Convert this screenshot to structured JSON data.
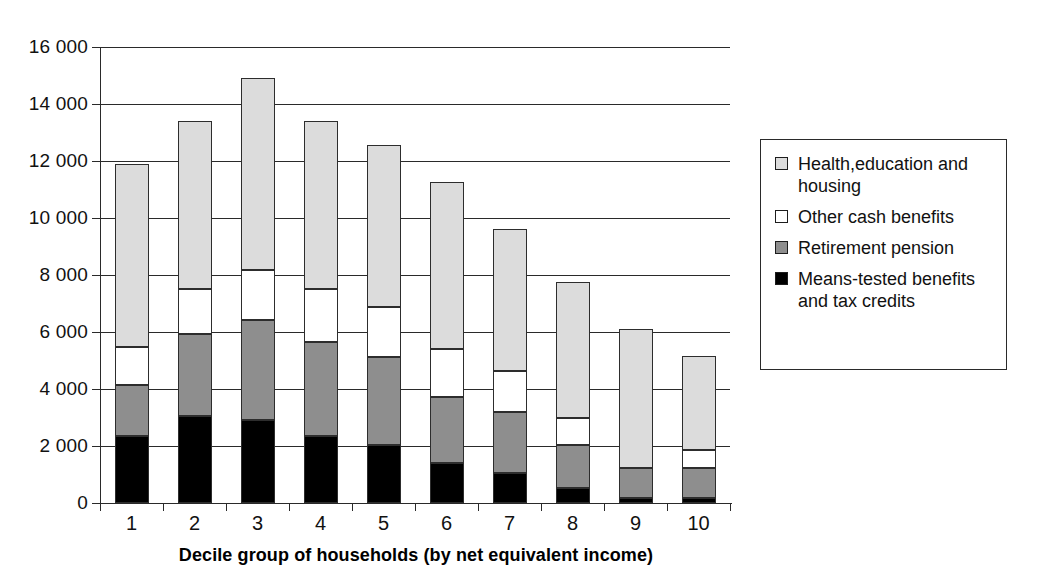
{
  "chart_data": {
    "type": "bar",
    "subtype": "stacked-vertical",
    "title": "",
    "xlabel": "Decile group of households (by net equivalent income)",
    "ylabel": "",
    "categories": [
      "1",
      "2",
      "3",
      "4",
      "5",
      "6",
      "7",
      "8",
      "9",
      "10"
    ],
    "ylim": [
      0,
      16000
    ],
    "yticks": [
      0,
      2000,
      4000,
      6000,
      8000,
      10000,
      12000,
      14000,
      16000
    ],
    "ytick_labels": [
      "0",
      "2 000",
      "4 000",
      "6 000",
      "8 000",
      "10 000",
      "12 000",
      "14 000",
      "16 000"
    ],
    "grid": "horizontal",
    "legend_position": "right-outside",
    "stack_order_bottom_to_top": [
      "Means-tested benefits and tax credits",
      "Retirement pension",
      "Other cash benefits",
      "Health,education and housing"
    ],
    "series": [
      {
        "name": "Means-tested benefits and tax credits",
        "color": "#000000",
        "values": [
          2340,
          3050,
          2920,
          2350,
          2050,
          1400,
          1050,
          530,
          180,
          180
        ]
      },
      {
        "name": "Retirement pension",
        "color": "#8e8e8e",
        "values": [
          1810,
          2880,
          3500,
          3310,
          3060,
          2320,
          2140,
          1510,
          1060,
          1050
        ]
      },
      {
        "name": "Other cash benefits",
        "color": "#ffffff",
        "values": [
          1320,
          1580,
          1760,
          1850,
          1780,
          1680,
          1440,
          950,
          0,
          630
        ]
      },
      {
        "name": "Health,education and housing",
        "color": "#dcdcdc",
        "values": [
          6410,
          5890,
          6720,
          5890,
          5670,
          5860,
          4990,
          4750,
          4860,
          3290
        ]
      }
    ],
    "totals": [
      11880,
      13400,
      14900,
      13400,
      12560,
      11260,
      9620,
      7740,
      6100,
      5150
    ]
  },
  "legend": {
    "entries": [
      {
        "label": "Health,education and housing",
        "swatch": "#dcdcdc"
      },
      {
        "label": "Other cash benefits",
        "swatch": "#ffffff"
      },
      {
        "label": "Retirement pension",
        "swatch": "#8e8e8e"
      },
      {
        "label": "Means-tested benefits and tax credits",
        "swatch": "#000000"
      }
    ]
  }
}
